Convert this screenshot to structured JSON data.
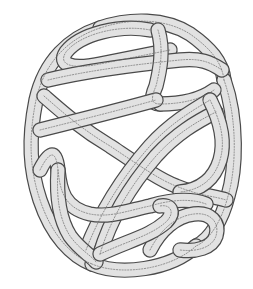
{
  "figure": {
    "canvas": {
      "width": 253,
      "height": 289
    },
    "colors": {
      "background": "#ffffff",
      "band_fill": "#e2e2e2",
      "band_outline": "#4a4a4a",
      "mid_line": "#6a6a6a"
    },
    "band_width": 13,
    "outline_width": 1.2,
    "mid_line_dash": "1.2 1.6",
    "bands": [
      {
        "name": "outer-rim-left",
        "d": "M 100 28 C 70 38, 45 60, 36 100 C 28 140, 30 170, 40 200 C 52 236, 72 256, 92 264"
      },
      {
        "name": "outer-rim-top",
        "d": "M 100 28 C 130 18, 165 18, 190 34 C 210 48, 222 62, 224 80"
      },
      {
        "name": "outer-rim-right",
        "d": "M 224 80 C 238 120, 236 170, 228 196 C 222 220, 210 240, 196 246"
      },
      {
        "name": "outer-rim-bottom",
        "d": "M 92 264 C 120 276, 170 270, 196 246"
      },
      {
        "name": "top-inner-loop",
        "d": "M 150 30 C 120 24, 80 34, 66 52 C 58 64, 70 70, 100 64 C 130 58, 160 52, 170 50"
      },
      {
        "name": "upper-crossbar",
        "d": "M 48 80 C 90 70, 140 64, 180 60 C 200 58, 210 62, 222 70"
      },
      {
        "name": "upper-right-strut",
        "d": "M 158 30 C 164 50, 160 70, 156 86 C 150 100, 152 104, 160 104"
      },
      {
        "name": "mid-crossbar-right",
        "d": "M 160 104 C 180 104, 200 100, 214 90"
      },
      {
        "name": "left-diagonal",
        "d": "M 44 96 C 60 110, 80 128, 110 146 C 140 166, 160 180, 176 186 C 200 196, 214 196, 226 200"
      },
      {
        "name": "mid-crossbar-left",
        "d": "M 40 130 C 80 120, 120 110, 156 100"
      },
      {
        "name": "long-diagonal-ne",
        "d": "M 86 250 C 100 214, 120 180, 150 146 C 170 124, 190 112, 210 100"
      },
      {
        "name": "long-diagonal-ne-2",
        "d": "M 100 254 C 110 220, 130 186, 156 156 C 176 134, 196 122, 216 112"
      },
      {
        "name": "right-loop",
        "d": "M 210 100 C 220 120, 226 140, 220 160 C 214 180, 200 190, 180 192"
      },
      {
        "name": "lower-left-loop",
        "d": "M 40 170 C 50 150, 56 150, 58 170 C 60 190, 64 208, 90 214 C 110 218, 130 210, 150 206 C 170 200, 190 198, 206 204"
      },
      {
        "name": "lower-left-strut",
        "d": "M 58 170 C 56 200, 60 220, 70 236 C 80 250, 92 256, 96 262"
      },
      {
        "name": "bottom-right-loop",
        "d": "M 150 250 C 160 230, 176 216, 194 214 C 210 212, 220 222, 216 236 C 212 248, 196 252, 180 250"
      },
      {
        "name": "bottom-inner-curve",
        "d": "M 100 254 C 130 240, 150 236, 166 222 C 176 212, 170 204, 160 206"
      }
    ]
  }
}
